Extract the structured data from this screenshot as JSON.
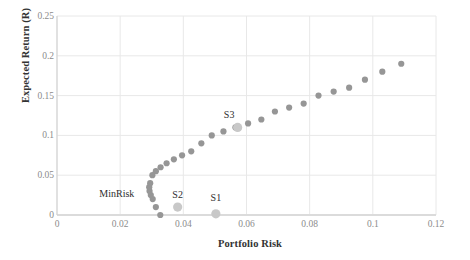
{
  "chart_data": {
    "type": "scatter",
    "title": "",
    "xlabel": "Portfolio Risk",
    "ylabel": "Expected Return (R)",
    "xlim": [
      0,
      0.12
    ],
    "ylim": [
      0,
      0.25
    ],
    "xticks": [
      "0",
      "0.02",
      "0.04",
      "0.06",
      "0.08",
      "0.1",
      "0.12"
    ],
    "xtick_values": [
      0,
      0.02,
      0.04,
      0.06,
      0.08,
      0.1,
      0.12
    ],
    "yticks": [
      "0",
      "0.05",
      "0.1",
      "0.15",
      "0.2",
      "0.25"
    ],
    "ytick_values": [
      0,
      0.05,
      0.1,
      0.15,
      0.2,
      0.25
    ],
    "grid": true,
    "legend": "none",
    "series": [
      {
        "name": "Efficient Frontier",
        "marker": "circle",
        "color": "#969696",
        "radius": 3.1,
        "x": [
          0.0327,
          0.0313,
          0.0303,
          0.0297,
          0.0293,
          0.0292,
          0.0295,
          0.0302,
          0.0313,
          0.0328,
          0.0347,
          0.037,
          0.0396,
          0.0425,
          0.0457,
          0.049,
          0.0527,
          0.0565,
          0.0605,
          0.0647,
          0.069,
          0.0735,
          0.0781,
          0.0828,
          0.0876,
          0.0925,
          0.0975,
          0.103,
          0.109
        ],
        "y": [
          0.0,
          0.01,
          0.02,
          0.025,
          0.03,
          0.035,
          0.04,
          0.05,
          0.055,
          0.06,
          0.065,
          0.07,
          0.075,
          0.08,
          0.09,
          0.1,
          0.105,
          0.11,
          0.115,
          0.12,
          0.13,
          0.135,
          0.14,
          0.15,
          0.155,
          0.16,
          0.17,
          0.18,
          0.19
        ]
      },
      {
        "name": "Highlighted Portfolios",
        "marker": "circle",
        "color": "#c8c8c8",
        "radius": 4.6,
        "points": [
          {
            "label": "S1",
            "x": 0.0503,
            "y": 0.0015
          },
          {
            "label": "S2",
            "x": 0.0382,
            "y": 0.01
          },
          {
            "label": "S3",
            "x": 0.0572,
            "y": 0.11
          }
        ]
      }
    ],
    "annotations": [
      {
        "text": "MinRisk",
        "x": 0.0245,
        "y": 0.0282,
        "anchor": "right"
      },
      {
        "text": "S2",
        "x": 0.0382,
        "y": 0.0268,
        "anchor": "center"
      },
      {
        "text": "S1",
        "x": 0.0503,
        "y": 0.0232,
        "anchor": "center"
      },
      {
        "text": "S3",
        "x": 0.0545,
        "y": 0.127,
        "anchor": "center"
      }
    ]
  },
  "colors": {
    "marker": "#969696",
    "marker_highlight": "#c8c8c8",
    "grid": "#e8e8e8",
    "axis": "#cfcfcf",
    "tick_text": "#8c8c8c",
    "title_text": "#333333",
    "background": "#ffffff"
  }
}
